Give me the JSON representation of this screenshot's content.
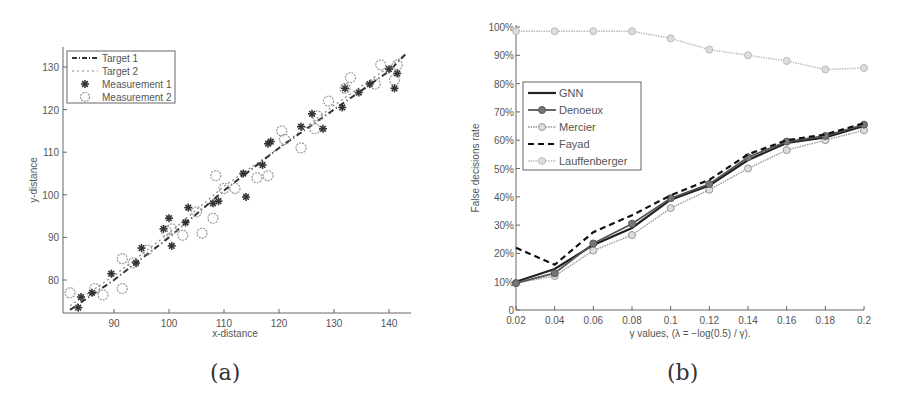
{
  "chart_data": [
    {
      "id": "a",
      "type": "scatter",
      "caption": "(a)",
      "title": "",
      "xlabel": "x-distance",
      "ylabel": "y-distance",
      "xlim": [
        81,
        143
      ],
      "ylim": [
        72,
        135
      ],
      "xticks": [
        90,
        100,
        110,
        120,
        130,
        140
      ],
      "yticks": [
        80,
        90,
        100,
        110,
        120,
        130
      ],
      "grid": false,
      "legend_position": "upper-left",
      "legend": [
        "Target 1",
        "Target 2",
        "Measurement 1",
        "Measurement 2"
      ],
      "series": [
        {
          "name": "Target 1",
          "style": "dash-dot",
          "color": "#333333",
          "x": [
            82,
            90,
            100,
            110,
            120,
            130,
            140,
            143
          ],
          "y": [
            73,
            80,
            90,
            101,
            111,
            120,
            129,
            133
          ]
        },
        {
          "name": "Target 2",
          "style": "dotted-tilde",
          "color": "#888888",
          "x": [
            82,
            90,
            100,
            110,
            120,
            130,
            140,
            143
          ],
          "y": [
            74,
            81,
            91,
            102,
            111,
            121,
            130,
            133
          ]
        },
        {
          "name": "Measurement 1",
          "marker": "asterisk",
          "color": "#333333",
          "x": [
            83.5,
            84,
            86,
            89.5,
            94,
            95,
            99,
            100,
            100.5,
            103,
            103.5,
            108,
            109,
            113.5,
            114,
            117,
            118,
            118.5,
            124,
            126,
            128,
            131.5,
            132,
            134.5,
            136.5,
            140,
            141,
            141.5
          ],
          "y": [
            73.5,
            76,
            77,
            81.5,
            84,
            87.5,
            92,
            94.5,
            88,
            93.5,
            97,
            98,
            98.5,
            105,
            99.5,
            107,
            112,
            112.5,
            116,
            119,
            115.5,
            120.5,
            125,
            124,
            126,
            129.5,
            125,
            128.5
          ]
        },
        {
          "name": "Measurement 2",
          "marker": "circle",
          "color": "#999999",
          "x": [
            82,
            86.5,
            88,
            91.5,
            91.5,
            93.5,
            96,
            99.5,
            100.5,
            102.5,
            105,
            106,
            108,
            108.5,
            110,
            112,
            116,
            118,
            120.5,
            121,
            124,
            126.5,
            127,
            129,
            132,
            133,
            137.5,
            138.5,
            141,
            141.5
          ],
          "y": [
            77,
            78,
            76.5,
            85,
            78,
            84,
            87,
            91.5,
            92,
            90.5,
            96,
            91,
            94.5,
            104.5,
            101.5,
            101.5,
            104,
            104.5,
            115,
            113,
            111,
            115.5,
            118.5,
            122,
            125,
            127.5,
            126,
            130.5,
            127,
            130.5
          ]
        }
      ]
    },
    {
      "id": "b",
      "type": "line",
      "caption": "(b)",
      "title": "",
      "xlabel": "γ values, (λ = −log(0.5) / γ).",
      "ylabel": "False decisions rate",
      "x": [
        0.02,
        0.04,
        0.06,
        0.08,
        0.1,
        0.12,
        0.14,
        0.16,
        0.18,
        0.2
      ],
      "xticks": [
        "0.02",
        "0.04",
        "0.06",
        "0.08",
        "0.1",
        "0.12",
        "0.14",
        "0.16",
        "0.18",
        "0.2"
      ],
      "yticks": [
        "0",
        "10%",
        "20%",
        "30%",
        "40%",
        "50%",
        "60%",
        "70%",
        "80%",
        "90%",
        "100%"
      ],
      "xlim": [
        0.02,
        0.2
      ],
      "ylim": [
        0,
        100
      ],
      "grid": false,
      "legend_position": "upper-left (inset)",
      "legend": [
        "GNN",
        "Denoeux",
        "Mercier",
        "Fayad",
        "Lauffenberger"
      ],
      "series": [
        {
          "name": "GNN",
          "style": "solid",
          "marker": "none",
          "color": "#222222",
          "values": [
            10,
            14.5,
            23,
            29,
            39,
            44,
            53,
            59,
            61,
            65
          ]
        },
        {
          "name": "Denoeux",
          "style": "solid",
          "marker": "circle-filled",
          "color": "#555555",
          "values": [
            9.5,
            13,
            23.5,
            30.5,
            39.5,
            44.5,
            54,
            59.5,
            61.5,
            65.5
          ]
        },
        {
          "name": "Mercier",
          "style": "dotted",
          "marker": "diamond-hatched",
          "color": "#999999",
          "values": [
            9.5,
            12,
            21,
            26.5,
            36,
            42.5,
            50,
            56.5,
            60,
            63.5
          ]
        },
        {
          "name": "Fayad",
          "style": "dashed",
          "marker": "none",
          "color": "#111111",
          "values": [
            22,
            16,
            27.5,
            33.5,
            40.5,
            46,
            55,
            60,
            62,
            66
          ]
        },
        {
          "name": "Lauffenberger",
          "style": "dotted",
          "marker": "circle-hatched",
          "color": "#b5b5b5",
          "values": [
            98.5,
            98.5,
            98.5,
            98.5,
            96,
            92,
            90,
            88,
            85,
            85.5
          ]
        }
      ]
    }
  ],
  "captions": {
    "a": "(a)",
    "b": "(b)"
  }
}
